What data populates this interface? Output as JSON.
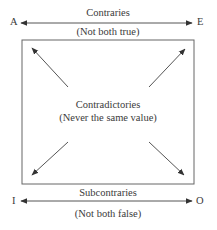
{
  "diagram": {
    "corners": {
      "top_left": "A",
      "top_right": "E",
      "bottom_left": "I",
      "bottom_right": "O"
    },
    "top_relation": {
      "name": "Contraries",
      "description": "(Not both true)"
    },
    "diagonal_relation": {
      "name": "Contradictories",
      "description": "(Never the same value)"
    },
    "bottom_relation": {
      "name": "Subcontraries",
      "description": "(Not both false)"
    },
    "colors": {
      "line": "#555555",
      "text": "#3a3a3a",
      "background": "#ffffff"
    }
  }
}
